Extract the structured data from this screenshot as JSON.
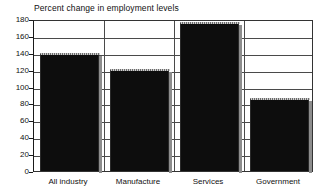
{
  "chart_data": {
    "type": "bar",
    "title": "Percent change in employment levels",
    "xlabel": "",
    "ylabel": "",
    "categories": [
      "All industry",
      "Manufacture",
      "Services",
      "Government"
    ],
    "values": [
      140,
      121,
      177,
      87
    ],
    "ylim": [
      0,
      180
    ],
    "yticks": [
      0,
      20,
      40,
      60,
      80,
      100,
      120,
      140,
      160,
      180
    ],
    "ytick_labels": [
      "0",
      "20",
      "40",
      "60",
      "80",
      "100",
      "120",
      "140",
      "160",
      "180"
    ],
    "grid": true,
    "legend": null,
    "bar_color": "#0d0d0d",
    "grid_color": "#4a4a4a",
    "axis_color": "#1a1a1a",
    "background": "#ffffff"
  }
}
